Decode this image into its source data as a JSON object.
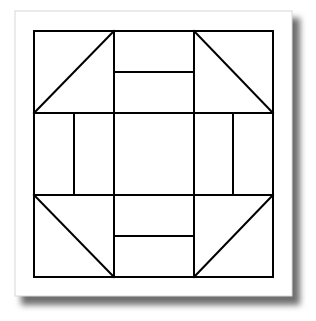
{
  "diagram": {
    "colors": {
      "background": "#ffffff",
      "paper": "#ffffff",
      "paper_border": "#d8d8d8",
      "shadow": "#6e6e6e",
      "line": "#000000"
    },
    "paper": {
      "x": 15,
      "y": 11,
      "w": 277,
      "h": 285
    },
    "block": {
      "x": 34,
      "y": 31,
      "size": 239
    },
    "grid": {
      "cols": [
        34,
        114,
        194,
        273
      ],
      "rows": [
        31,
        113,
        195,
        277
      ]
    },
    "inner_lines": {
      "top_center_y": 72,
      "bottom_center_y": 236,
      "left_center_x": 74,
      "right_center_x": 233
    },
    "corner_triangles": [
      {
        "name": "top-left",
        "from": [
          34,
          113
        ],
        "to": [
          114,
          31
        ]
      },
      {
        "name": "top-right",
        "from": [
          194,
          31
        ],
        "to": [
          273,
          113
        ]
      },
      {
        "name": "bottom-left",
        "from": [
          34,
          195
        ],
        "to": [
          114,
          277
        ]
      },
      {
        "name": "bottom-right",
        "from": [
          194,
          277
        ],
        "to": [
          273,
          195
        ]
      }
    ]
  }
}
